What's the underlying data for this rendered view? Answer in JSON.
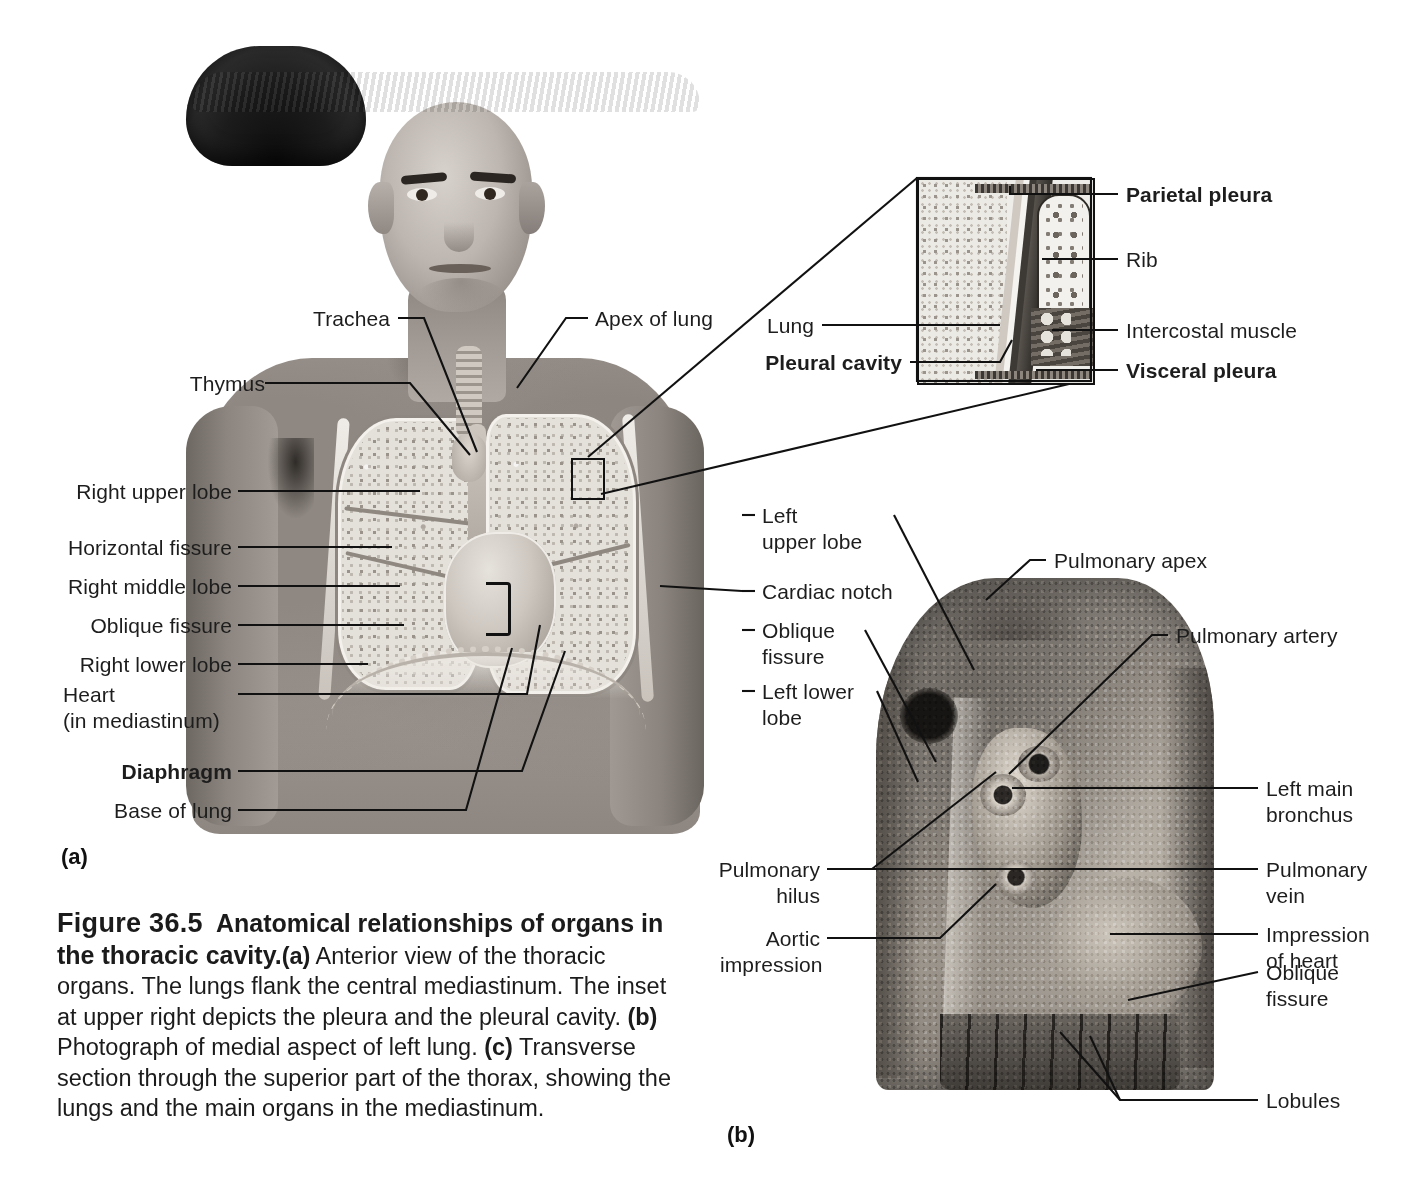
{
  "figure": {
    "panel_a_mark": "(a)",
    "panel_b_mark": "(b)"
  },
  "caption": {
    "figure_number": "Figure 36.5",
    "title": "Anatomical relationships of organs in the thoracic cavity.",
    "part_a_mark": "(a)",
    "part_a_text": " Anterior view of the thoracic organs. The lungs flank the central mediastinum. The inset at upper right depicts the pleura and the pleural cavity. ",
    "part_b_mark": "(b)",
    "part_b_text": " Photograph of medial aspect of left lung. ",
    "part_c_mark": "(c)",
    "part_c_text": " Transverse section through the superior part of the thorax, showing the lungs and the main organs in the mediastinum."
  },
  "panel_a_labels": {
    "trachea": "Trachea",
    "thymus": "Thymus",
    "apex_of_lung": "Apex of lung",
    "right_upper_lobe": "Right upper lobe",
    "horizontal_fissure": "Horizontal fissure",
    "right_middle_lobe": "Right middle lobe",
    "oblique_fissure": "Oblique fissure",
    "right_lower_lobe": "Right lower lobe",
    "heart_line1": "Heart",
    "heart_line2": "(in mediastinum)",
    "diaphragm": "Diaphragm",
    "base_of_lung": "Base of lung",
    "left_upper_lobe_line1": "Left",
    "left_upper_lobe_line2": "upper lobe",
    "cardiac_notch": "Cardiac notch",
    "oblique_fissure_r_line1": "Oblique",
    "oblique_fissure_r_line2": "fissure",
    "left_lower_lobe_line1": "Left lower",
    "left_lower_lobe_line2": "lobe"
  },
  "inset_labels": {
    "parietal_pleura": "Parietal pleura",
    "rib": "Rib",
    "intercostal_muscle": "Intercostal muscle",
    "visceral_pleura": "Visceral pleura",
    "lung": "Lung",
    "pleural_cavity": "Pleural cavity"
  },
  "panel_b_labels": {
    "pulmonary_apex": "Pulmonary apex",
    "pulmonary_artery": "Pulmonary artery",
    "left_main_bronchus_line1": "Left main",
    "left_main_bronchus_line2": "bronchus",
    "pulmonary_vein_line1": "Pulmonary",
    "pulmonary_vein_line2": "vein",
    "impression_of_heart_line1": "Impression",
    "impression_of_heart_line2": "of heart",
    "oblique_fissure_line1": "Oblique",
    "oblique_fissure_line2": "fissure",
    "lobules": "Lobules",
    "pulmonary_hilus_line1": "Pulmonary",
    "pulmonary_hilus_line2": "hilus",
    "aortic_impression_line1": "Aortic",
    "aortic_impression_line2": "impression"
  },
  "style": {
    "background": "#ffffff",
    "text_color": "#1d1d1d",
    "leader_color": "#111111"
  }
}
